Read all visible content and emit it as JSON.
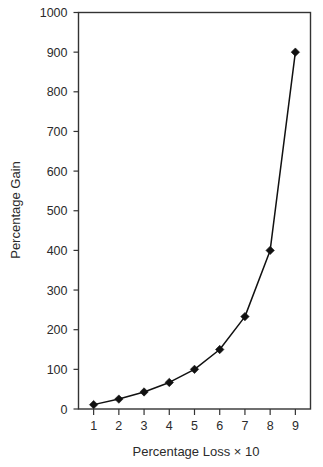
{
  "chart_data": {
    "type": "line",
    "title": "",
    "xlabel": "Percentage Loss × 10",
    "ylabel": "Percentage Gain",
    "x": [
      1,
      2,
      3,
      4,
      5,
      6,
      7,
      8,
      9
    ],
    "values": [
      11,
      25,
      43,
      67,
      100,
      150,
      233,
      400,
      900
    ],
    "series": [
      {
        "name": "Percentage Gain",
        "values": [
          11,
          25,
          43,
          67,
          100,
          150,
          233,
          400,
          900
        ]
      }
    ],
    "xlim": [
      0.4,
      9.6
    ],
    "ylim": [
      0,
      1000
    ],
    "x_tick_labels": [
      "1",
      "2",
      "3",
      "4",
      "5",
      "6",
      "7",
      "8",
      "9"
    ],
    "y_tick_labels": [
      "0",
      "100",
      "200",
      "300",
      "400",
      "500",
      "600",
      "700",
      "800",
      "900",
      "1000"
    ],
    "y_ticks": [
      0,
      100,
      200,
      300,
      400,
      500,
      600,
      700,
      800,
      900,
      1000
    ],
    "grid": false,
    "legend": false,
    "legend_position": "none",
    "marker": "diamond",
    "line_color": "#111111",
    "marker_color": "#111111",
    "frame_color": "#333333",
    "background_color": "#ffffff"
  },
  "axes": {
    "y_axis_title": "Percentage Gain",
    "x_axis_title": "Percentage Loss × 10"
  }
}
